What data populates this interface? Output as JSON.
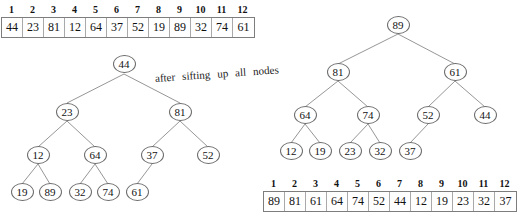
{
  "figure": {
    "caption": {
      "text": "after sifting up all nodes",
      "words": [
        "after",
        "sifting",
        "up",
        "all",
        "nodes"
      ]
    },
    "left": {
      "array": {
        "indices": [
          "1",
          "2",
          "3",
          "4",
          "5",
          "6",
          "7",
          "8",
          "9",
          "10",
          "11",
          "12"
        ],
        "values": [
          "44",
          "23",
          "81",
          "12",
          "64",
          "37",
          "52",
          "19",
          "89",
          "32",
          "74",
          "61"
        ]
      },
      "tree": {
        "levels": [
          [
            "44"
          ],
          [
            "23",
            "81"
          ],
          [
            "12",
            "64",
            "37",
            "52"
          ],
          [
            "19",
            "89",
            "32",
            "74",
            "61"
          ]
        ],
        "nodes": [
          "44",
          "23",
          "81",
          "12",
          "64",
          "37",
          "52",
          "19",
          "89",
          "32",
          "74",
          "61"
        ]
      }
    },
    "right": {
      "array": {
        "indices": [
          "1",
          "2",
          "3",
          "4",
          "5",
          "6",
          "7",
          "8",
          "9",
          "10",
          "11",
          "12"
        ],
        "values": [
          "89",
          "81",
          "61",
          "64",
          "74",
          "52",
          "44",
          "12",
          "19",
          "23",
          "32",
          "37"
        ]
      },
      "tree": {
        "levels": [
          [
            "89"
          ],
          [
            "81",
            "61"
          ],
          [
            "64",
            "74",
            "52",
            "44"
          ],
          [
            "12",
            "19",
            "23",
            "32",
            "37"
          ]
        ],
        "nodes": [
          "89",
          "81",
          "61",
          "64",
          "74",
          "52",
          "44",
          "12",
          "19",
          "23",
          "32",
          "37"
        ]
      }
    },
    "colors": {
      "stroke": "#6a6a6a",
      "edge": "#8a8a8a",
      "text": "#111111",
      "background": "#ffffff"
    }
  }
}
